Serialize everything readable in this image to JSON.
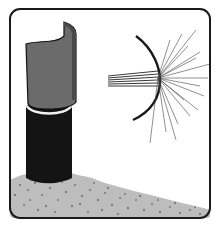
{
  "illustration": {
    "subject": "pipe-with-flared-sleeve-and-radiating-spray",
    "colors": {
      "background": "#ffffff",
      "frame": "#1a1a1a",
      "sleeve": "#6b6b6b",
      "pipe": "#141414",
      "ring": "#f2f2f2",
      "ground": "#b8b8b8",
      "ground_speckle": "#2a2a2a",
      "rays": "#333333"
    }
  }
}
